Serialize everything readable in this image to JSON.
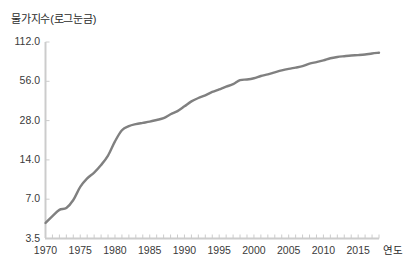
{
  "chart_data": {
    "type": "line",
    "title": "물가지수(로그눈금)",
    "xlabel": "연도",
    "ylabel": "",
    "yscale": "log",
    "ylim": [
      3.5,
      112.0
    ],
    "xlim": [
      1970,
      2018
    ],
    "grid": false,
    "legend": "none",
    "line_color": "#808080",
    "axis_color": "#cccccc",
    "ytick_labels": [
      "112.0",
      "56.0",
      "28.0",
      "14.0",
      "7.0",
      "3.5"
    ],
    "ytick_values": [
      112.0,
      56.0,
      28.0,
      14.0,
      7.0,
      3.5
    ],
    "xtick_labels": [
      "1970",
      "1975",
      "1980",
      "1985",
      "1990",
      "1995",
      "2000",
      "2005",
      "2010",
      "2015"
    ],
    "xtick_values": [
      1970,
      1975,
      1980,
      1985,
      1990,
      1995,
      2000,
      2005,
      2010,
      2015
    ],
    "x": [
      1970,
      1971,
      1972,
      1973,
      1974,
      1975,
      1976,
      1977,
      1978,
      1979,
      1980,
      1981,
      1982,
      1983,
      1984,
      1985,
      1986,
      1987,
      1988,
      1989,
      1990,
      1991,
      1992,
      1993,
      1994,
      1995,
      1996,
      1997,
      1998,
      1999,
      2000,
      2001,
      2002,
      2003,
      2004,
      2005,
      2006,
      2007,
      2008,
      2009,
      2010,
      2011,
      2012,
      2013,
      2014,
      2015,
      2016,
      2017,
      2018
    ],
    "values": [
      4.6,
      5.2,
      5.8,
      6.0,
      6.9,
      8.7,
      10.1,
      11.2,
      12.8,
      15.1,
      19.4,
      23.6,
      25.4,
      26.3,
      26.9,
      27.5,
      28.3,
      29.2,
      31.3,
      33.1,
      36.0,
      39.3,
      41.7,
      43.7,
      46.4,
      48.6,
      51.0,
      53.2,
      57.2,
      57.8,
      59.1,
      61.5,
      63.2,
      65.5,
      67.8,
      69.7,
      71.3,
      73.1,
      76.5,
      78.6,
      80.9,
      84.1,
      86.0,
      87.2,
      88.3,
      88.9,
      89.8,
      91.5,
      92.7
    ],
    "series_name": "물가지수"
  }
}
